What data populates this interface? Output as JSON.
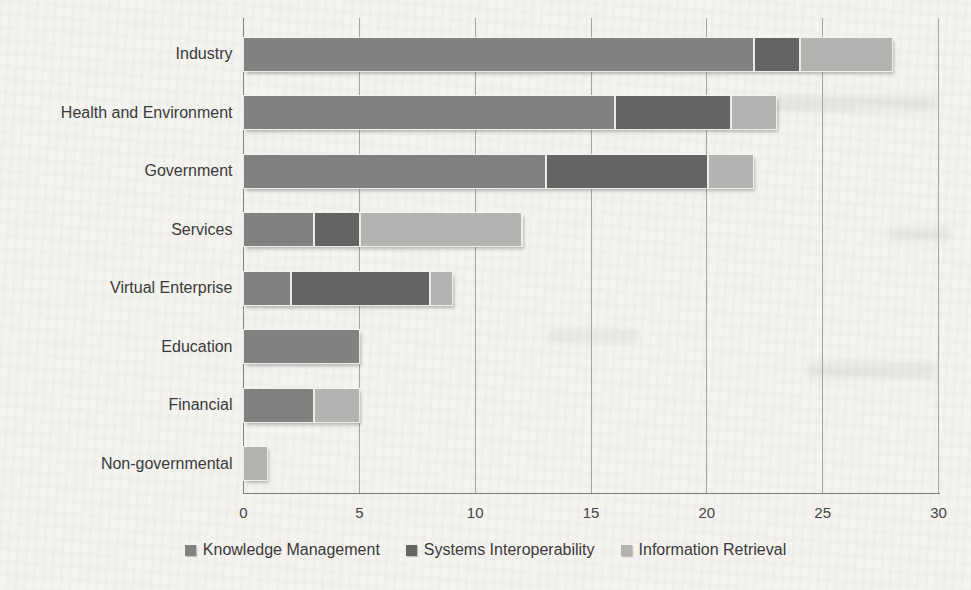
{
  "chart_data": {
    "type": "bar",
    "orientation": "horizontal",
    "stacked": true,
    "title": "",
    "xlabel": "",
    "ylabel": "",
    "categories": [
      "Industry",
      "Health and Environment",
      "Government",
      "Services",
      "Virtual Enterprise",
      "Education",
      "Financial",
      "Non-governmental"
    ],
    "series": [
      {
        "name": "Knowledge Management",
        "color": "#818181",
        "values": [
          22,
          16,
          13,
          3,
          2,
          5,
          3,
          0
        ]
      },
      {
        "name": "Systems Interoperability",
        "color": "#646464",
        "values": [
          2,
          5,
          7,
          2,
          6,
          0,
          0,
          0
        ]
      },
      {
        "name": "Information Retrieval",
        "color": "#b3b3b1",
        "values": [
          4,
          2,
          2,
          7,
          1,
          0,
          2,
          1
        ]
      }
    ],
    "xlim": [
      0,
      30
    ],
    "x_ticks": [
      "0",
      "5",
      "10",
      "15",
      "20",
      "25",
      "30"
    ],
    "grid": true,
    "legend_position": "bottom"
  }
}
